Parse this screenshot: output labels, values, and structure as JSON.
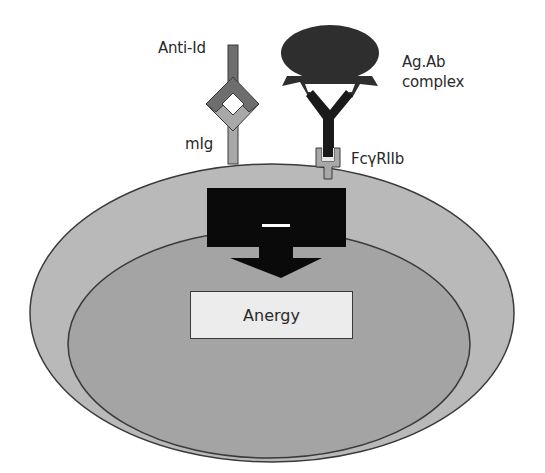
{
  "diagram": {
    "labels": {
      "anti_id": "Anti-Id",
      "mig": "mIg",
      "agab_line1": "Ag.Ab",
      "agab_line2": "complex",
      "fc_receptor": "FcγRIIb",
      "inhibition_sign": "–",
      "outcome": "Anergy"
    },
    "nodes": [
      {
        "id": "anti-id",
        "label": "Anti-Id",
        "shape": "Y-receptor",
        "color": "#6e6e6e"
      },
      {
        "id": "mig",
        "label": "mIg",
        "shape": "Y-receptor",
        "color": "#a8a8a8"
      },
      {
        "id": "agab",
        "label": "Ag.Ab complex",
        "shape": "blob + Y antibody",
        "color": "#2e2e2e"
      },
      {
        "id": "fcgriib",
        "label": "FcγRIIb",
        "shape": "cup receptor",
        "color": "#a8a8a8"
      },
      {
        "id": "inhibitory-signal",
        "label": "–",
        "shape": "block arrow",
        "color": "#0a0a0a"
      },
      {
        "id": "anergy",
        "label": "Anergy",
        "shape": "rectangle",
        "color": "#ececec"
      }
    ],
    "edges": [
      {
        "from": "anti-id",
        "to": "mig",
        "type": "binding"
      },
      {
        "from": "agab",
        "to": "fcgriib",
        "type": "binding"
      },
      {
        "from": "inhibitory-signal",
        "to": "anergy",
        "type": "arrow"
      }
    ],
    "colors": {
      "cell_outer": "#b9b9b9",
      "cell_inner": "#a4a4a4",
      "outline": "#3a3a3a",
      "signal_block": "#0a0a0a",
      "anti_id": "#6e6e6e",
      "mig": "#a8a8a8",
      "agab": "#2e2e2e"
    }
  }
}
